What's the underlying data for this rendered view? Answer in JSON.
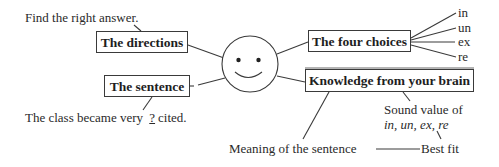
{
  "diagram": {
    "instruction": "Find the right answer.",
    "center_icon": "smiley-face-icon",
    "boxes": {
      "directions": "The directions",
      "sentence": "The sentence",
      "four_choices": "The four choices",
      "knowledge": "Knowledge from your brain"
    },
    "choices": [
      "in",
      "un",
      "ex",
      "re"
    ],
    "example_sentence": {
      "before": "The class became very ",
      "blank": "?",
      "after": "cited."
    },
    "knowledge_items": {
      "sound_value_label": "Sound value of",
      "sound_value_items": "in, un, ex, re",
      "meaning": "Meaning of the sentence",
      "best_fit": "Best fit"
    },
    "colors": {
      "line": "#3a3a3a",
      "text": "#2a2a2a",
      "background": "#ffffff"
    }
  }
}
